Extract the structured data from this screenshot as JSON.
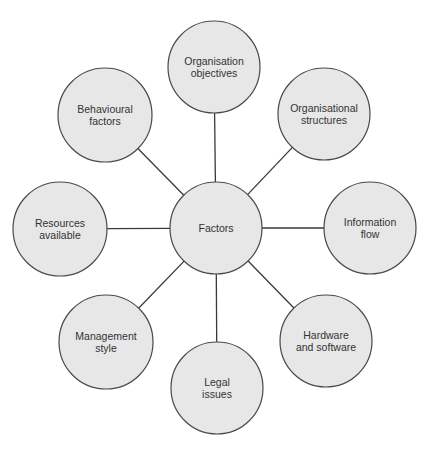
{
  "diagram": {
    "type": "hub-and-spoke",
    "colors": {
      "node_fill": "#e7e7e7",
      "node_stroke": "#4a4a4a",
      "connector": "#3a3a3a",
      "text": "#333333",
      "background": "#ffffff"
    },
    "center": {
      "id": "factors",
      "lines": [
        "Factors"
      ],
      "cx": 216,
      "cy": 228,
      "r": 46
    },
    "nodes": [
      {
        "id": "organisation-objectives",
        "lines": [
          "Organisation",
          "objectives"
        ],
        "cx": 214,
        "cy": 67,
        "r": 46
      },
      {
        "id": "organisational-structures",
        "lines": [
          "Organisational",
          "structures"
        ],
        "cx": 324,
        "cy": 114,
        "r": 46
      },
      {
        "id": "information-flow",
        "lines": [
          "Information",
          "flow"
        ],
        "cx": 370,
        "cy": 228,
        "r": 46
      },
      {
        "id": "hardware-and-software",
        "lines": [
          "Hardware",
          "and software"
        ],
        "cx": 326,
        "cy": 341,
        "r": 46
      },
      {
        "id": "legal-issues",
        "lines": [
          "Legal",
          "issues"
        ],
        "cx": 217,
        "cy": 388,
        "r": 46
      },
      {
        "id": "management-style",
        "lines": [
          "Management",
          "style"
        ],
        "cx": 106,
        "cy": 342,
        "r": 47
      },
      {
        "id": "resources-available",
        "lines": [
          "Resources",
          "available"
        ],
        "cx": 60,
        "cy": 229,
        "r": 47
      },
      {
        "id": "behavioural-factors",
        "lines": [
          "Behavioural",
          "factors"
        ],
        "cx": 105,
        "cy": 115,
        "r": 47
      }
    ]
  }
}
